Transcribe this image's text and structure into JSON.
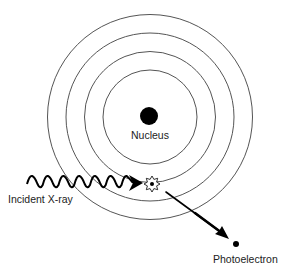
{
  "diagram": {
    "labels": {
      "nucleus": "Nucleus",
      "incident": "Incident X-ray",
      "photoelectron": "Photoelectron"
    },
    "shells": {
      "count": 4,
      "center": [
        150,
        117
      ],
      "radii": [
        47,
        65,
        84,
        102
      ],
      "stroke": "#555555"
    },
    "nucleus": {
      "center": [
        149,
        116
      ],
      "radius": 9,
      "fill": "#000000"
    },
    "interaction_point": {
      "center": [
        152,
        184
      ],
      "shape": "starburst"
    },
    "incident_wave": {
      "start_x": 27,
      "end_x": 132,
      "center_y": 180,
      "amplitude": 4.5,
      "cycles": 10
    },
    "ejection_arrow": {
      "from": [
        167,
        193
      ],
      "to": [
        228,
        238
      ]
    },
    "photoelectron_dot": {
      "center": [
        236,
        244
      ],
      "radius": 3
    },
    "colors": {
      "ink": "#000000",
      "shell": "#555555",
      "text": "#222222",
      "background": "#ffffff"
    }
  }
}
